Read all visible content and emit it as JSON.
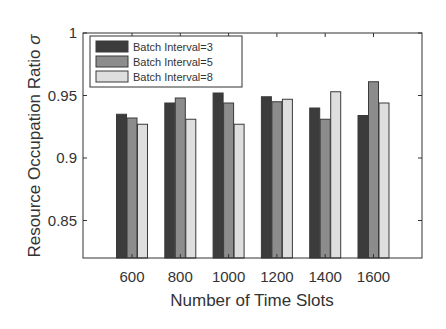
{
  "chart_data": {
    "type": "bar",
    "title": "",
    "xlabel": "Number of Time Slots",
    "ylabel": "Resource Occupation Ratio σ",
    "categories": [
      "600",
      "800",
      "1000",
      "1200",
      "1400",
      "1600"
    ],
    "series": [
      {
        "name": "Batch Interval=3",
        "color": "#3c3c3c",
        "values": [
          0.935,
          0.944,
          0.952,
          0.949,
          0.94,
          0.934
        ]
      },
      {
        "name": "Batch Interval=5",
        "color": "#8c8c8c",
        "values": [
          0.932,
          0.948,
          0.944,
          0.945,
          0.931,
          0.961
        ]
      },
      {
        "name": "Batch Interval=8",
        "color": "#dedede",
        "values": [
          0.927,
          0.931,
          0.927,
          0.947,
          0.953,
          0.944
        ]
      }
    ],
    "ylim": [
      0.82,
      1.0
    ],
    "yticks": [
      0.85,
      0.9,
      0.95,
      1
    ],
    "ytick_labels": [
      "0.85",
      "0.9",
      "0.95",
      "1"
    ],
    "grid": false,
    "legend_position": "upper left"
  }
}
